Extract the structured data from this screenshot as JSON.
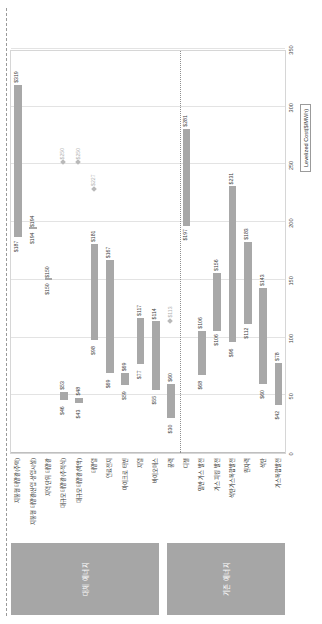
{
  "figure": {
    "axis_title": "Levelized Cost($/MWh)",
    "x_ticks": [
      "0",
      "50",
      "100",
      "150",
      "200",
      "250",
      "300",
      "350"
    ],
    "x_min": 0,
    "x_max": 350
  },
  "groups": [
    {
      "name": "대체 에너지",
      "start_row": 0,
      "end_row": 10
    },
    {
      "name": "기존 에너지",
      "start_row": 11,
      "end_row": 18
    }
  ],
  "chart_data": {
    "type": "bar",
    "orientation": "horizontal",
    "title": "",
    "xlabel": "Levelized Cost($/MWh)",
    "ylabel": "",
    "xlim": [
      0,
      350
    ],
    "grid": true,
    "legend": "none",
    "note": "Range bars (low-high) per technology; diamond markers denote single point values.",
    "categories": [
      "지붕형 태양광(주택)",
      "지붕형 태양광(산업·상업시설)",
      "지역 단위 태양광",
      "대규모 태양광(추적식)",
      "대규모 태양광(박막)",
      "태양열",
      "연료전지",
      "마이크로 터빈",
      "지열",
      "바이오매스",
      "풍력",
      "디젤",
      "일반 가스 발전",
      "가스 피킹 발전",
      "석탄가스복합발전",
      "원자력",
      "석탄",
      "가스복합발전"
    ],
    "low_values": [
      187,
      194,
      150,
      46,
      43,
      98,
      69,
      59,
      77,
      55,
      30,
      197,
      68,
      106,
      96,
      112,
      60,
      42
    ],
    "high_values": [
      319,
      194,
      150,
      53,
      48,
      181,
      167,
      69,
      117,
      114,
      60,
      281,
      106,
      156,
      231,
      183,
      143,
      78
    ],
    "marker_values": [
      null,
      null,
      null,
      250,
      250,
      227,
      null,
      null,
      null,
      null,
      113,
      null,
      null,
      null,
      null,
      null,
      null,
      null
    ],
    "value_labels": [
      {
        "low": "$187",
        "high": "$319"
      },
      {
        "low": "$194",
        "high": "$194"
      },
      {
        "low": "$150",
        "high": "$150"
      },
      {
        "low": "$46",
        "high": "$53",
        "marker": "$250"
      },
      {
        "low": "$43",
        "high": "$48",
        "marker": "$250"
      },
      {
        "low": "$98",
        "high": "$181",
        "marker": "$227"
      },
      {
        "low": "$69",
        "high": "$167"
      },
      {
        "low": "$59",
        "high": "$69"
      },
      {
        "low": "$77",
        "high": "$117"
      },
      {
        "low": "$55",
        "high": "$114"
      },
      {
        "low": "$30",
        "high": "$60",
        "marker": "$113"
      },
      {
        "low": "$197",
        "high": "$281"
      },
      {
        "low": "$68",
        "high": "$106"
      },
      {
        "low": "$106",
        "high": "$156"
      },
      {
        "low": "$96",
        "high": "$231"
      },
      {
        "low": "$112",
        "high": "$183"
      },
      {
        "low": "$60",
        "high": "$143"
      },
      {
        "low": "$42",
        "high": "$78"
      }
    ]
  },
  "colors": {
    "bar": "#a8a8a8",
    "group_box": "#a6a6a6",
    "grid": "#e3e3e3",
    "separator": "#8f8f8f",
    "text": "#2b2b2b"
  }
}
